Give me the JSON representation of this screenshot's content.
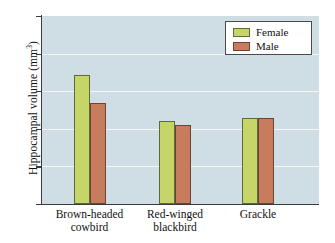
{
  "chart_data": {
    "type": "bar",
    "title": "",
    "xlabel": "",
    "ylabel": "Hippocampal volume (mm3)",
    "ylabel_text": "Hippocampal volume (mm",
    "ylabel_sup": "3",
    "ylabel_close": ")",
    "categories": [
      "Brown-headed cowbird",
      "Red-winged blackbird",
      "Grackle"
    ],
    "category_lines": [
      [
        "Brown-headed",
        "cowbird"
      ],
      [
        "Red-winged",
        "blackbird"
      ],
      [
        "Grackle",
        ""
      ]
    ],
    "series": [
      {
        "name": "Female",
        "color": "#c6d568",
        "values": [
          6.85,
          4.4,
          4.55
        ]
      },
      {
        "name": "Male",
        "color": "#c87c5e",
        "values": [
          5.35,
          4.2,
          4.58
        ]
      }
    ],
    "ylim": [
      0,
      10
    ],
    "yticks": [
      10,
      8,
      6,
      4,
      2,
      0
    ],
    "ytick_labels": [
      "10",
      "8",
      "6",
      "4",
      "2",
      "0"
    ],
    "grid": true,
    "legend_position": "top-right",
    "plot_background": "#cfdde4"
  },
  "legend": {
    "items": [
      {
        "label": "Female",
        "swatch": "female"
      },
      {
        "label": "Male",
        "swatch": "male"
      }
    ]
  }
}
